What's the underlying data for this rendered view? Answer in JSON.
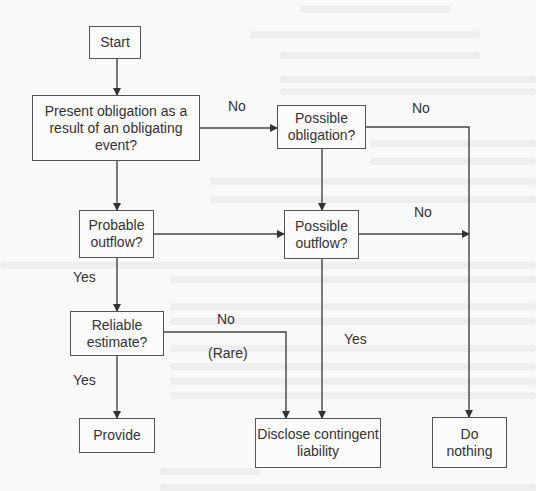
{
  "diagram": {
    "type": "flowchart",
    "nodes": {
      "start": "Start",
      "present_obligation": "Present obligation as a\nresult of an obligating\nevent?",
      "possible_obligation": "Possible\nobligation?",
      "probable_outflow": "Probable\noutflow?",
      "possible_outflow": "Possible\noutflow?",
      "reliable_estimate": "Reliable\nestimate?",
      "provide": "Provide",
      "disclose": "Disclose contingent\nliability",
      "do_nothing": "Do\nnothing"
    },
    "edge_labels": {
      "present_no": "No",
      "possible_obligation_no": "No",
      "possible_outflow_no": "No",
      "probable_yes": "Yes",
      "reliable_no": "No",
      "reliable_rare": "(Rare)",
      "reliable_yes": "Yes",
      "possible_outflow_yes": "Yes"
    },
    "edges": [
      {
        "from": "start",
        "to": "present_obligation"
      },
      {
        "from": "present_obligation",
        "to": "possible_obligation",
        "label": "No"
      },
      {
        "from": "present_obligation",
        "to": "probable_outflow"
      },
      {
        "from": "possible_obligation",
        "to": "possible_outflow"
      },
      {
        "from": "possible_obligation",
        "to": "do_nothing",
        "label": "No"
      },
      {
        "from": "probable_outflow",
        "to": "possible_outflow"
      },
      {
        "from": "probable_outflow",
        "to": "reliable_estimate",
        "label": "Yes"
      },
      {
        "from": "possible_outflow",
        "to": "do_nothing",
        "label": "No"
      },
      {
        "from": "possible_outflow",
        "to": "disclose",
        "label": "Yes"
      },
      {
        "from": "reliable_estimate",
        "to": "provide",
        "label": "Yes"
      },
      {
        "from": "reliable_estimate",
        "to": "disclose",
        "label": "No (Rare)"
      }
    ]
  },
  "colors": {
    "line": "#444444",
    "box_border": "#555555",
    "background": "#f9f9f9",
    "text": "#333333"
  }
}
